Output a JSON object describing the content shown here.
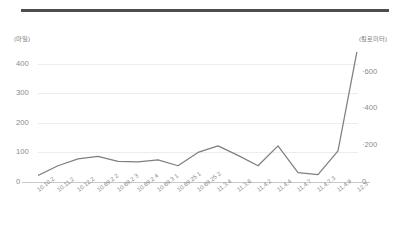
{
  "top_rule": {
    "color": "#4d4d4d"
  },
  "axes": {
    "left_unit": "(마일)",
    "right_unit": "(킬로미터)",
    "left_ticks": [
      "0",
      "100",
      "200",
      "300",
      "400"
    ],
    "right_ticks": [
      "0",
      "200",
      "400",
      "600"
    ],
    "right_tick_marker": "·"
  },
  "chart_data": {
    "type": "line",
    "title": "",
    "subtitle": "",
    "xlabel": "",
    "ylabel": "(마일)",
    "y2label": "(킬로미터)",
    "ylim": [
      0,
      460
    ],
    "y2lim": [
      0,
      740
    ],
    "yticks": [
      0,
      100,
      200,
      300,
      400
    ],
    "y2ticks": [
      0,
      200,
      400,
      600
    ],
    "grid": true,
    "legend": false,
    "legend_position": "none",
    "line_color": "#7f7f7f",
    "categories": [
      "10.10.2",
      "10.11.2",
      "10.12.2",
      "10.69.2 2",
      "10.69.2 3",
      "10.69.2 4",
      "10.69.3 1",
      "10.69.25 1",
      "10.69.25 2",
      "11.3.4",
      "11.3.6",
      "11.4.2",
      "11.4.4",
      "11.4.7",
      "11.4.7.3",
      "11.4.9",
      "12.3"
    ],
    "series": [
      {
        "name": "거리",
        "values": [
          22,
          55,
          78,
          87,
          70,
          68,
          75,
          55,
          100,
          122,
          90,
          55,
          122,
          32,
          25,
          105,
          460
        ]
      }
    ]
  }
}
